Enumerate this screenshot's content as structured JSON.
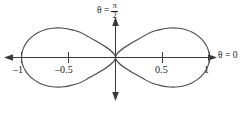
{
  "figure": {
    "name": "lemniscate-polar-plot",
    "background_color": "#ffffff",
    "curve_color": "#4a4a4a",
    "axis_color": "#3a3a3a",
    "text_color": "#1b1b1b"
  },
  "labels": {
    "vertical_axis": {
      "theta_equals": "θ =",
      "numerator": "π",
      "denominator": "2",
      "full_text": "θ = π/2"
    },
    "horizontal_axis": {
      "full_text": "θ = 0"
    }
  },
  "chart_data": {
    "type": "line",
    "title": "",
    "subtitle": "",
    "plot_kind": "polar-lemniscate",
    "equation": "r² = cos 2θ",
    "xlabel": "θ = 0",
    "ylabel": "θ = π/2",
    "grid": false,
    "legend": false,
    "xlim": [
      -1.2,
      1.2
    ],
    "ylim": [
      -0.55,
      0.55
    ],
    "x_ticks": [
      -1,
      -0.5,
      0.5,
      1
    ],
    "x_tick_labels": [
      "–1",
      "–0.5",
      "0.5",
      "1"
    ],
    "y_ticks": [],
    "y_tick_labels": [],
    "annotations": [
      {
        "text": "θ = 0",
        "position": "right-of-positive-x-axis"
      },
      {
        "text": "θ = π/2",
        "position": "above-positive-y-axis"
      }
    ],
    "series": [
      {
        "name": "lemniscate r = +sqrt(cos 2θ)",
        "color": "#4a4a4a",
        "closed": true,
        "points": [
          [
            1.0,
            0.0
          ],
          [
            0.9949,
            0.0501
          ],
          [
            0.9796,
            0.0995
          ],
          [
            0.9541,
            0.1472
          ],
          [
            0.9186,
            0.1921
          ],
          [
            0.8729,
            0.2329
          ],
          [
            0.8168,
            0.2679
          ],
          [
            0.7497,
            0.2951
          ],
          [
            0.6705,
            0.3117
          ],
          [
            0.5768,
            0.3136
          ],
          [
            0.4634,
            0.2936
          ],
          [
            0.3173,
            0.2377
          ],
          [
            0.0,
            0.0
          ],
          [
            0.3173,
            -0.2377
          ],
          [
            0.4634,
            -0.2936
          ],
          [
            0.5768,
            -0.3136
          ],
          [
            0.6705,
            -0.3117
          ],
          [
            0.7497,
            -0.2951
          ],
          [
            0.8168,
            -0.2679
          ],
          [
            0.8729,
            -0.2329
          ],
          [
            0.9186,
            -0.1921
          ],
          [
            0.9541,
            -0.1472
          ],
          [
            0.9796,
            -0.0995
          ],
          [
            0.9949,
            -0.0501
          ],
          [
            1.0,
            0.0
          ]
        ]
      },
      {
        "name": "lemniscate r = -sqrt(cos 2θ)",
        "color": "#4a4a4a",
        "closed": true,
        "points": [
          [
            -1.0,
            0.0
          ],
          [
            -0.9949,
            0.0501
          ],
          [
            -0.9796,
            0.0995
          ],
          [
            -0.9541,
            0.1472
          ],
          [
            -0.9186,
            0.1921
          ],
          [
            -0.8729,
            0.2329
          ],
          [
            -0.8168,
            0.2679
          ],
          [
            -0.7497,
            0.2951
          ],
          [
            -0.6705,
            0.3117
          ],
          [
            -0.5768,
            0.3136
          ],
          [
            -0.4634,
            0.2936
          ],
          [
            -0.3173,
            0.2377
          ],
          [
            0.0,
            0.0
          ],
          [
            -0.3173,
            -0.2377
          ],
          [
            -0.4634,
            -0.2936
          ],
          [
            -0.5768,
            -0.3136
          ],
          [
            -0.6705,
            -0.3117
          ],
          [
            -0.7497,
            -0.2951
          ],
          [
            -0.8168,
            -0.2679
          ],
          [
            -0.8729,
            -0.2329
          ],
          [
            -0.9186,
            -0.1921
          ],
          [
            -0.9541,
            -0.1472
          ],
          [
            -0.9796,
            -0.0995
          ],
          [
            -0.9949,
            -0.0501
          ],
          [
            -1.0,
            0.0
          ]
        ]
      }
    ]
  }
}
